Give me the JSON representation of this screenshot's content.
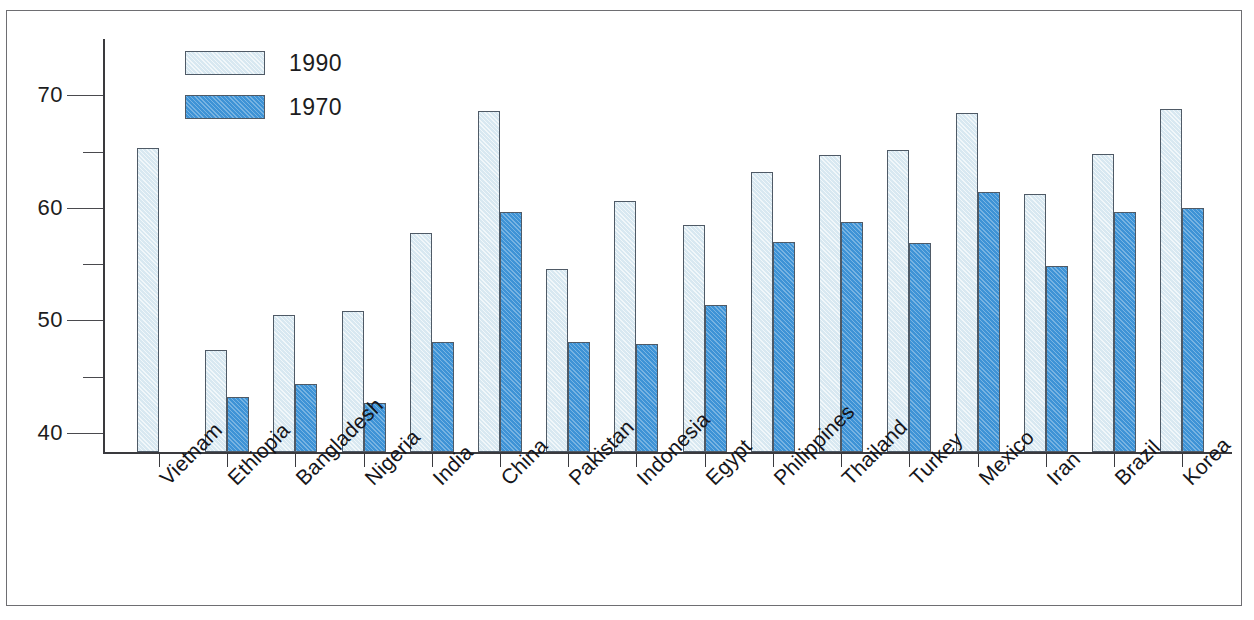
{
  "chart_data": {
    "type": "bar",
    "title": "",
    "subtitle": "",
    "xlabel": "",
    "ylabel": "",
    "ylim": [
      38.3,
      75.0
    ],
    "yticks": [
      40,
      50,
      60,
      70
    ],
    "ytick_labels": [
      "40",
      "50",
      "60",
      "70"
    ],
    "yticks_minor": [
      45,
      55,
      65
    ],
    "grid": false,
    "legend_position": "top-left-inside",
    "categories": [
      "Vietnam",
      "Ethiopia",
      "Bangladesh",
      "Nigeria",
      "India",
      "China",
      "Pakistan",
      "Indonesia",
      "Egypt",
      "Philippines",
      "Thailand",
      "Turkey",
      "Mexico",
      "Iran",
      "Brazil",
      "Korea"
    ],
    "series": [
      {
        "name": "1990",
        "color": "#d8e8f1",
        "values": [
          65.3,
          47.4,
          50.5,
          50.8,
          57.8,
          68.6,
          54.6,
          60.6,
          58.5,
          63.2,
          64.7,
          65.1,
          68.4,
          61.2,
          64.8,
          68.8
        ]
      },
      {
        "name": "1970",
        "color": "#3e93d6",
        "values": [
          null,
          43.2,
          44.3,
          42.7,
          48.1,
          59.6,
          48.1,
          47.9,
          51.4,
          57.0,
          58.7,
          56.9,
          61.4,
          54.8,
          59.6,
          60.0
        ]
      }
    ]
  },
  "legend": {
    "entries": [
      {
        "label": "1990",
        "swatch": "light-blue-hatched"
      },
      {
        "label": "1970",
        "swatch": "blue-hatched"
      }
    ]
  },
  "colors": {
    "series_1990": "#d8e8f1",
    "series_1970": "#3e93d6",
    "bar_outline": "#4f5a66",
    "axis": "#3a3a3e",
    "frame": "#6e6e72",
    "text": "#1c1c20",
    "background": "#ffffff"
  }
}
